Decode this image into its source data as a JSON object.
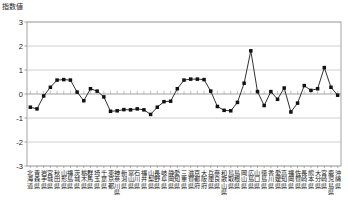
{
  "chart_data": {
    "type": "line",
    "title": "",
    "subtitle": "",
    "ylabel": "指数値",
    "xlabel": "",
    "ylim": [
      -3,
      3
    ],
    "yticks": [
      3,
      2,
      1,
      0,
      -1,
      -2,
      -3
    ],
    "grid": true,
    "legend": null,
    "marker": "filled-square",
    "line_color": "#1a1a1a",
    "marker_color": "#111111",
    "grid_color": "#b9b9b9",
    "axis_color": "#7d7d7d",
    "categories": [
      "北海道",
      "青森県",
      "岩手県",
      "宮城県",
      "秋田県",
      "山形県",
      "福島県",
      "茨城県",
      "栃木県",
      "群馬県",
      "埼玉県",
      "千葉県",
      "東京都",
      "神奈川県",
      "新潟県",
      "富山県",
      "石川県",
      "福井県",
      "山梨県",
      "長野県",
      "岐阜県",
      "静岡県",
      "愛知県",
      "三重県",
      "滋賀県",
      "京都府",
      "大阪府",
      "兵庫県",
      "奈良県",
      "和歌山県",
      "鳥取県",
      "島根県",
      "岡山県",
      "広島県",
      "山口県",
      "徳島県",
      "香川県",
      "愛媛県",
      "高知県",
      "福岡県",
      "佐賀県",
      "長崎県",
      "熊本県",
      "大分県",
      "宮崎県",
      "鹿児島県",
      "沖縄県"
    ],
    "values": [
      -0.55,
      -0.62,
      -0.08,
      0.28,
      0.58,
      0.6,
      0.58,
      0.08,
      -0.28,
      0.22,
      0.12,
      -0.12,
      -0.72,
      -0.7,
      -0.65,
      -0.66,
      -0.62,
      -0.66,
      -0.85,
      -0.55,
      -0.32,
      -0.3,
      0.22,
      0.58,
      0.62,
      0.62,
      0.6,
      0.12,
      -0.52,
      -0.68,
      -0.7,
      -0.35,
      0.45,
      1.8,
      0.1,
      -0.48,
      0.1,
      -0.22,
      0.25,
      -0.75,
      -0.38,
      0.35,
      0.15,
      0.22,
      1.1,
      0.28,
      -0.05
    ]
  },
  "plot": {
    "x_start": 27,
    "x_end": 341,
    "y_top": 22,
    "y_bottom": 166
  }
}
